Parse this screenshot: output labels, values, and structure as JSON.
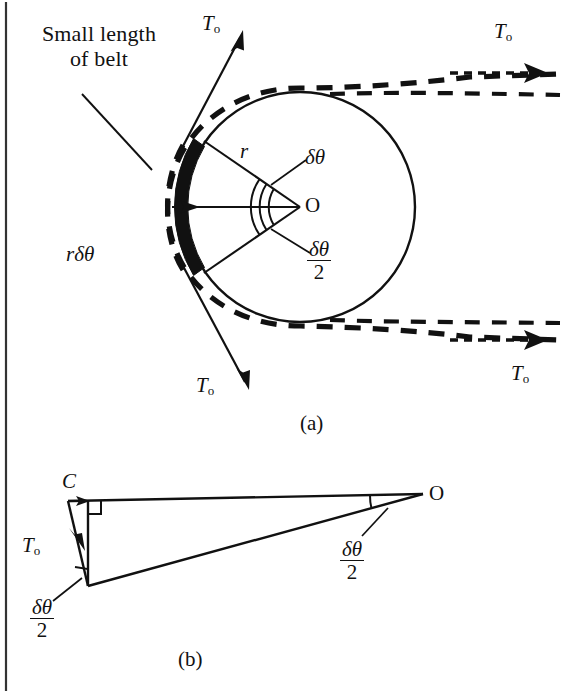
{
  "figure": {
    "title_visible": false,
    "background_color": "#ffffff",
    "ink_color": "#111111",
    "border": {
      "left_rule": true
    }
  },
  "panel_a": {
    "label": "(a)",
    "annotation_note": {
      "line1": "Small length",
      "line2": "of belt"
    },
    "labels": {
      "tension_top_left": "T",
      "tension_top_left_sub": "o",
      "tension_top_right": "T",
      "tension_top_right_sub": "o",
      "tension_bottom_left": "T",
      "tension_bottom_left_sub": "o",
      "tension_bottom_right": "T",
      "tension_bottom_right_sub": "o",
      "radius": "r",
      "normal_force": "F",
      "arc_length_num": "r",
      "arc_length_delta": "δθ",
      "center": "O",
      "angle_full": "δθ",
      "angle_half_num": "δθ",
      "angle_half_den": "2"
    },
    "geometry": {
      "circle_center_x": 300,
      "circle_center_y": 207,
      "circle_radius": 115,
      "belt_inner_radius": 118,
      "belt_outer_radius": 132,
      "belt_half_angle_deg": 36
    }
  },
  "panel_b": {
    "label": "(b)",
    "labels": {
      "vertex_c": "C",
      "vertex_o": "O",
      "tension": "T",
      "tension_sub": "o",
      "angle_at_o_num": "δθ",
      "angle_at_o_den": "2",
      "angle_at_b_num": "δθ",
      "angle_at_b_den": "2"
    },
    "geometry": {
      "vertex_c_x": 70,
      "vertex_c_y": 501,
      "vertex_o_x": 423,
      "vertex_o_y": 496,
      "vertex_b_x": 88,
      "vertex_b_y": 585
    }
  }
}
